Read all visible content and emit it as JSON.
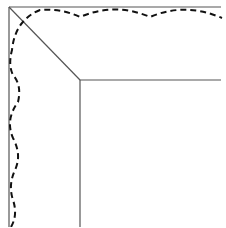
{
  "diagram": {
    "colors": {
      "background": "#ffffff",
      "solid_line": "#555555",
      "dashed_line": "#111111"
    },
    "outer_frame": {
      "corner": [
        9,
        7
      ],
      "right_end_x": 221,
      "bottom_end_y": 227
    },
    "inner_frame": {
      "corner": [
        80,
        80
      ],
      "right_end_x": 221,
      "bottom_end_y": 227
    },
    "diagonal": {
      "from": [
        9,
        7
      ],
      "to": [
        80,
        80
      ]
    },
    "dashed_path": "M 11 227 Q 18 215 13 200 Q 8 185 15 170 Q 22 155 13 138 Q 5 120 18 102 Q 22 85 13 75 Q 8 65 12 50 Q 15 20 40 10 Q 60 8 80 17 Q 115 2 150 17 Q 185 2 222 18",
    "dash_pattern": "6,4"
  }
}
